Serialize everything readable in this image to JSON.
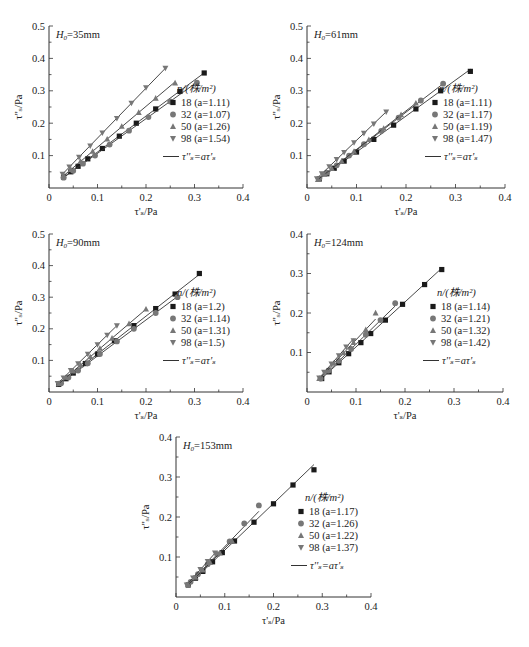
{
  "figure": {
    "width": 529,
    "height": 647,
    "colors": {
      "axis": "#333333",
      "line": "#333333",
      "marker_18": "#1a1a1a",
      "marker_32": "#777777",
      "marker_50": "#777777",
      "marker_98": "#777777"
    }
  },
  "chart_data": [
    {
      "type": "scatter",
      "panel_label": "H0=35mm",
      "title_main": "H",
      "title_sub": "0",
      "title_rest": "=35mm",
      "xlabel": "τ'ₛ/Pa",
      "ylabel": "τ''ₛ/Pa",
      "xlim": [
        0,
        0.4
      ],
      "ylim": [
        0,
        0.5
      ],
      "xticks": [
        "0",
        "0.1",
        "0.2",
        "0.3",
        "0.4"
      ],
      "yticks": [
        "0.1",
        "0.2",
        "0.3",
        "0.4",
        "0.5"
      ],
      "grid": false,
      "legend_title": "n/(株/m²)",
      "legend_position": "lower right",
      "fit_label": "τ''ₛ=aτ'ₛ",
      "series": [
        {
          "name": "18 (a=1.11)",
          "n": "18",
          "a": 1.11,
          "marker": "square",
          "x": [
            0.03,
            0.045,
            0.06,
            0.08,
            0.11,
            0.145,
            0.18,
            0.22,
            0.27,
            0.32
          ],
          "y": [
            0.034,
            0.05,
            0.067,
            0.09,
            0.122,
            0.16,
            0.2,
            0.244,
            0.298,
            0.355
          ]
        },
        {
          "name": "32 (a=1.07)",
          "n": "32",
          "a": 1.07,
          "marker": "circle",
          "x": [
            0.03,
            0.05,
            0.07,
            0.095,
            0.125,
            0.165,
            0.205,
            0.25,
            0.305
          ],
          "y": [
            0.032,
            0.053,
            0.075,
            0.1,
            0.134,
            0.177,
            0.219,
            0.267,
            0.325
          ]
        },
        {
          "name": "50 (a=1.26)",
          "n": "50",
          "a": 1.26,
          "marker": "triangle-up",
          "x": [
            0.03,
            0.045,
            0.065,
            0.09,
            0.12,
            0.15,
            0.185,
            0.22,
            0.26
          ],
          "y": [
            0.038,
            0.057,
            0.082,
            0.113,
            0.151,
            0.19,
            0.233,
            0.277,
            0.324
          ]
        },
        {
          "name": "98 (a=1.54)",
          "n": "98",
          "a": 1.54,
          "marker": "triangle-down",
          "x": [
            0.028,
            0.042,
            0.062,
            0.085,
            0.11,
            0.14,
            0.17,
            0.2,
            0.24
          ],
          "y": [
            0.043,
            0.065,
            0.095,
            0.13,
            0.17,
            0.215,
            0.262,
            0.31,
            0.37
          ]
        }
      ]
    },
    {
      "type": "scatter",
      "panel_label": "H0=61mm",
      "title_main": "H",
      "title_sub": "0",
      "title_rest": "=61mm",
      "xlabel": "τ'ₛ/Pa",
      "ylabel": "τ''ₛ/Pa",
      "xlim": [
        0,
        0.4
      ],
      "ylim": [
        0,
        0.5
      ],
      "xticks": [
        "0",
        "0.1",
        "0.2",
        "0.3",
        "0.4"
      ],
      "yticks": [
        "0.1",
        "0.2",
        "0.3",
        "0.4",
        "0.5"
      ],
      "grid": false,
      "legend_title": "n/(株/m²)",
      "legend_position": "lower right",
      "fit_label": "τ''ₛ=aτ'ₛ",
      "series": [
        {
          "name": "18 (a=1.11)",
          "n": "18",
          "a": 1.11,
          "marker": "square",
          "x": [
            0.025,
            0.04,
            0.055,
            0.075,
            0.1,
            0.135,
            0.175,
            0.22,
            0.27,
            0.33
          ],
          "y": [
            0.028,
            0.044,
            0.061,
            0.083,
            0.111,
            0.15,
            0.194,
            0.244,
            0.3,
            0.36
          ]
        },
        {
          "name": "32 (a=1.17)",
          "n": "32",
          "a": 1.17,
          "marker": "circle",
          "x": [
            0.025,
            0.04,
            0.06,
            0.085,
            0.115,
            0.15,
            0.185,
            0.23,
            0.275
          ],
          "y": [
            0.029,
            0.047,
            0.07,
            0.1,
            0.135,
            0.176,
            0.217,
            0.27,
            0.322
          ]
        },
        {
          "name": "50 (a=1.19)",
          "n": "50",
          "a": 1.19,
          "marker": "triangle-up",
          "x": [
            0.022,
            0.035,
            0.05,
            0.07,
            0.095,
            0.125,
            0.155,
            0.19,
            0.22
          ],
          "y": [
            0.026,
            0.042,
            0.06,
            0.083,
            0.113,
            0.149,
            0.184,
            0.226,
            0.262
          ]
        },
        {
          "name": "98 (a=1.47)",
          "n": "98",
          "a": 1.47,
          "marker": "triangle-down",
          "x": [
            0.02,
            0.03,
            0.045,
            0.06,
            0.075,
            0.095,
            0.115,
            0.135,
            0.16
          ],
          "y": [
            0.029,
            0.044,
            0.066,
            0.088,
            0.11,
            0.14,
            0.169,
            0.198,
            0.235
          ]
        }
      ]
    },
    {
      "type": "scatter",
      "panel_label": "H0=90mm",
      "title_main": "H",
      "title_sub": "0",
      "title_rest": "=90mm",
      "xlabel": "τ'ₛ/Pa",
      "ylabel": "τ''ₛ/Pa",
      "xlim": [
        0,
        0.4
      ],
      "ylim": [
        0,
        0.5
      ],
      "xticks": [
        "0",
        "0.1",
        "0.2",
        "0.3",
        "0.4"
      ],
      "yticks": [
        "0.1",
        "0.2",
        "0.3",
        "0.4",
        "0.5"
      ],
      "grid": false,
      "legend_title": "n/(株/m²)",
      "legend_position": "lower right",
      "fit_label": "τ''ₛ=aτ'ₛ",
      "series": [
        {
          "name": "18 (a=1.2)",
          "n": "18",
          "a": 1.2,
          "marker": "square",
          "x": [
            0.02,
            0.035,
            0.05,
            0.075,
            0.1,
            0.135,
            0.175,
            0.22,
            0.26,
            0.31
          ],
          "y": [
            0.024,
            0.042,
            0.06,
            0.09,
            0.12,
            0.162,
            0.21,
            0.264,
            0.31,
            0.375
          ]
        },
        {
          "name": "32 (a=1.14)",
          "n": "32",
          "a": 1.14,
          "marker": "circle",
          "x": [
            0.025,
            0.04,
            0.06,
            0.08,
            0.105,
            0.14,
            0.175,
            0.22,
            0.265
          ],
          "y": [
            0.028,
            0.046,
            0.068,
            0.091,
            0.12,
            0.16,
            0.2,
            0.25,
            0.3
          ]
        },
        {
          "name": "50 (a=1.31)",
          "n": "50",
          "a": 1.31,
          "marker": "triangle-up",
          "x": [
            0.02,
            0.035,
            0.05,
            0.065,
            0.085,
            0.105,
            0.13,
            0.165,
            0.2
          ],
          "y": [
            0.026,
            0.046,
            0.066,
            0.085,
            0.111,
            0.138,
            0.17,
            0.216,
            0.262
          ]
        },
        {
          "name": "98 (a=1.5)",
          "n": "98",
          "a": 1.5,
          "marker": "triangle-down",
          "x": [
            0.018,
            0.03,
            0.045,
            0.06,
            0.08,
            0.1,
            0.12,
            0.14
          ],
          "y": [
            0.027,
            0.045,
            0.068,
            0.09,
            0.12,
            0.15,
            0.18,
            0.21
          ]
        }
      ]
    },
    {
      "type": "scatter",
      "panel_label": "H0=124mm",
      "title_main": "H",
      "title_sub": "0",
      "title_rest": "=124mm",
      "xlabel": "τ'ₛ/Pa",
      "ylabel": "τ''ₛ/Pa",
      "xlim": [
        0,
        0.4
      ],
      "ylim": [
        0,
        0.4
      ],
      "xticks": [
        "0",
        "0.1",
        "0.2",
        "0.3",
        "0.4"
      ],
      "yticks": [
        "0.1",
        "0.2",
        "0.3",
        "0.4"
      ],
      "grid": false,
      "legend_title": "n/(株/m²)",
      "legend_position": "lower right",
      "fit_label": "τ''ₛ=aτ'ₛ",
      "series": [
        {
          "name": "18 (a=1.14)",
          "n": "18",
          "a": 1.14,
          "marker": "square",
          "x": [
            0.03,
            0.045,
            0.065,
            0.085,
            0.11,
            0.13,
            0.16,
            0.195,
            0.24,
            0.275
          ],
          "y": [
            0.034,
            0.051,
            0.074,
            0.097,
            0.125,
            0.148,
            0.182,
            0.222,
            0.272,
            0.31
          ]
        },
        {
          "name": "32 (a=1.21)",
          "n": "32",
          "a": 1.21,
          "marker": "circle",
          "x": [
            0.028,
            0.045,
            0.065,
            0.09,
            0.12,
            0.15,
            0.18
          ],
          "y": [
            0.034,
            0.055,
            0.079,
            0.109,
            0.145,
            0.182,
            0.225
          ]
        },
        {
          "name": "50 (a=1.32)",
          "n": "50",
          "a": 1.32,
          "marker": "triangle-up",
          "x": [
            0.025,
            0.04,
            0.055,
            0.075,
            0.095,
            0.12,
            0.14
          ],
          "y": [
            0.034,
            0.053,
            0.073,
            0.099,
            0.125,
            0.158,
            0.2
          ]
        },
        {
          "name": "98 (a=1.42)",
          "n": "98",
          "a": 1.42,
          "marker": "triangle-down",
          "x": [
            0.025,
            0.035,
            0.05,
            0.065,
            0.08,
            0.095
          ],
          "y": [
            0.036,
            0.05,
            0.071,
            0.092,
            0.114,
            0.13
          ]
        }
      ]
    },
    {
      "type": "scatter",
      "panel_label": "H0=153mm",
      "title_main": "H",
      "title_sub": "0",
      "title_rest": "=153mm",
      "xlabel": "τ'ₛ/Pa",
      "ylabel": "τ''ₛ/Pa",
      "xlim": [
        0,
        0.4
      ],
      "ylim": [
        0,
        0.4
      ],
      "xticks": [
        "0",
        "0.1",
        "0.2",
        "0.3",
        "0.4"
      ],
      "yticks": [
        "0.1",
        "0.2",
        "0.3",
        "0.4"
      ],
      "grid": false,
      "legend_title": "n/(株/m²)",
      "legend_position": "lower right",
      "fit_label": "τ''ₛ=aτ'ₛ",
      "series": [
        {
          "name": "18 (a=1.17)",
          "n": "18",
          "a": 1.17,
          "marker": "square",
          "x": [
            0.025,
            0.04,
            0.055,
            0.075,
            0.095,
            0.12,
            0.16,
            0.2,
            0.24,
            0.283
          ],
          "y": [
            0.03,
            0.047,
            0.064,
            0.088,
            0.111,
            0.14,
            0.187,
            0.233,
            0.28,
            0.318
          ]
        },
        {
          "name": "32 (a=1.26)",
          "n": "32",
          "a": 1.26,
          "marker": "circle",
          "x": [
            0.03,
            0.045,
            0.065,
            0.085,
            0.11,
            0.14,
            0.17
          ],
          "y": [
            0.038,
            0.057,
            0.082,
            0.107,
            0.139,
            0.184,
            0.229
          ]
        },
        {
          "name": "50 (a=1.22)",
          "n": "50",
          "a": 1.22,
          "marker": "triangle-up",
          "x": [
            0.025,
            0.04,
            0.055,
            0.07,
            0.09,
            0.115
          ],
          "y": [
            0.031,
            0.049,
            0.067,
            0.086,
            0.11,
            0.14
          ]
        },
        {
          "name": "98 (a=1.37)",
          "n": "98",
          "a": 1.37,
          "marker": "triangle-down",
          "x": [
            0.022,
            0.035,
            0.05,
            0.065,
            0.08
          ],
          "y": [
            0.03,
            0.048,
            0.069,
            0.089,
            0.11
          ]
        }
      ]
    }
  ]
}
